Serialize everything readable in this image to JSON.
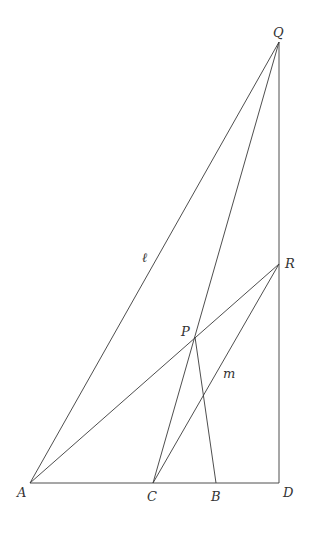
{
  "diagram": {
    "points": {
      "A": {
        "x": 30,
        "y": 483,
        "label": "A",
        "lx": 17,
        "ly": 497
      },
      "C": {
        "x": 153,
        "y": 483,
        "label": "C",
        "lx": 147,
        "ly": 501
      },
      "B": {
        "x": 216,
        "y": 483,
        "label": "B",
        "lx": 211,
        "ly": 501
      },
      "D": {
        "x": 279,
        "y": 483,
        "label": "D",
        "lx": 283,
        "ly": 497
      },
      "Q": {
        "x": 279,
        "y": 42,
        "label": "Q",
        "lx": 273,
        "ly": 37
      },
      "R": {
        "x": 279,
        "y": 264,
        "label": "R",
        "lx": 285,
        "ly": 268
      },
      "P": {
        "x": 195,
        "y": 337,
        "label": "P",
        "lx": 181,
        "ly": 336
      }
    },
    "segments": [
      {
        "from": "A",
        "to": "D",
        "name": "segment-AD"
      },
      {
        "from": "A",
        "to": "Q",
        "name": "line-l-AQ"
      },
      {
        "from": "A",
        "to": "R",
        "name": "segment-AR"
      },
      {
        "from": "Q",
        "to": "D",
        "name": "segment-QD"
      },
      {
        "from": "Q",
        "to": "C",
        "name": "segment-QC"
      },
      {
        "from": "P",
        "to": "B",
        "name": "segment-PB"
      },
      {
        "from": "C",
        "to": "R",
        "name": "line-m-CR"
      }
    ],
    "line_labels": [
      {
        "text": "ℓ",
        "x": 142,
        "y": 262,
        "name": "line-label-l"
      },
      {
        "text": "m",
        "x": 223,
        "y": 378,
        "name": "line-label-m"
      }
    ]
  }
}
